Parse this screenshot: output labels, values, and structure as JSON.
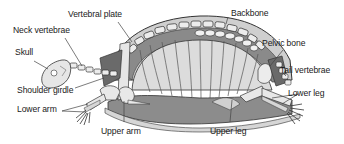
{
  "diagram": {
    "labels": {
      "vertebral_plate": "Vertebral plate",
      "backbone": "Backbone",
      "neck_vertebrae": "Neck vertebrae",
      "pelvic_bone": "Pelvic bone",
      "skull": "Skull",
      "tail_vertebrae": "Tail vertebrae",
      "shoulder_girdle": "Shoulder girdle",
      "lower_leg": "Lower leg",
      "lower_arm": "Lower arm",
      "upper_arm": "Upper arm",
      "upper_leg": "Upper leg"
    },
    "colors": {
      "shell_fill": "#d6d6d6",
      "bone_fill": "#e8e8e8",
      "dark_fill": "#7a7a7a",
      "outline": "#333333",
      "leader_line": "#444444"
    }
  }
}
